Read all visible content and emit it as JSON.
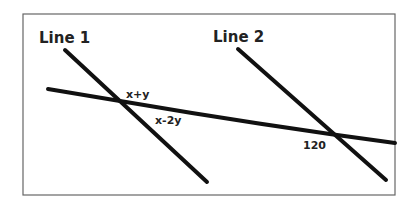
{
  "diagram": {
    "labels": {
      "line1": "Line 1",
      "line2": "Line 2",
      "angle_top": "x+y",
      "angle_bottom": "x-2y",
      "angle_120": "120"
    },
    "colors": {
      "stroke": "#111111",
      "frame": "#666666",
      "text": "#222222",
      "background": "#ffffff"
    }
  }
}
